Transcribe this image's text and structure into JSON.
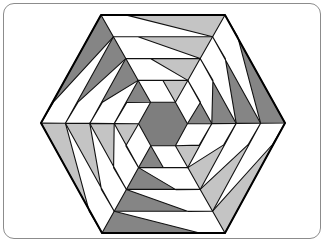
{
  "figure": {
    "name": "Log cabin hexagon pattern",
    "shape": "hexagon",
    "vertices": [
      [
        101,
        15
      ],
      [
        225,
        15
      ],
      [
        285,
        123
      ],
      [
        225,
        233
      ],
      [
        102,
        233
      ],
      [
        41,
        123
      ]
    ],
    "center": [
      163,
      124
    ],
    "rings": 4,
    "center_hex_scale": 0.2,
    "colors": {
      "light": "#c4c4c4",
      "dark": "#858585",
      "center": "#7e7e7e",
      "stroke": "#111111",
      "card_border": "#8c8c8c",
      "background": "#ffffff"
    },
    "side_shades": [
      "light",
      "dark",
      "light",
      "dark",
      "light",
      "dark"
    ]
  }
}
